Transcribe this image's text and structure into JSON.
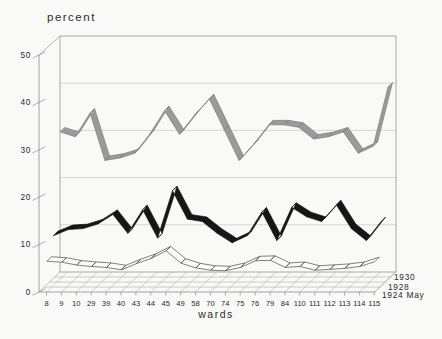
{
  "figure": {
    "y_axis_title": "percent",
    "x_axis_title": "wards",
    "background": "#f9f9f7"
  },
  "chart_data": {
    "type": "line",
    "style": "3d-ribbon",
    "title": "percent",
    "xlabel": "wards",
    "ylabel": "percent",
    "ylim": [
      0,
      50
    ],
    "y_ticks": [
      0,
      10,
      20,
      30,
      40,
      50
    ],
    "grid": true,
    "legend_position": "right-bottom",
    "categories": [
      "8",
      "9",
      "10",
      "29",
      "39",
      "40",
      "43",
      "44",
      "45",
      "49",
      "58",
      "70",
      "74",
      "75",
      "76",
      "79",
      "84",
      "110",
      "111",
      "112",
      "113",
      "114",
      "115"
    ],
    "series": [
      {
        "name": "1930",
        "color": "#9a9a9a",
        "edge_color": "#7c7c7c",
        "depth": "back",
        "values": [
          31,
          30,
          35,
          25,
          25.5,
          26.5,
          30.5,
          35.5,
          30.5,
          34.5,
          38,
          31.5,
          25,
          28.5,
          32.5,
          32.5,
          32,
          29.5,
          30,
          31,
          26.5,
          28,
          40.5
        ]
      },
      {
        "name": "1928",
        "color": "#161616",
        "edge_color": "#161616",
        "depth": "middle",
        "values": [
          10.5,
          11.8,
          12,
          13,
          15,
          11,
          16,
          10,
          20,
          14,
          13.5,
          11,
          9,
          10.5,
          15.5,
          9.5,
          16.5,
          14.5,
          13.5,
          17,
          12,
          9.5,
          13.5
        ]
      },
      {
        "name": "1924 May",
        "color": "#fbfbf9",
        "edge_color": "#4a4a4a",
        "depth": "front",
        "values": [
          6.4,
          6.2,
          5.6,
          5.3,
          5.1,
          4.6,
          5.9,
          7,
          8.6,
          6,
          5,
          4.5,
          4.4,
          5.1,
          6.5,
          6.6,
          5.1,
          5.3,
          4.5,
          4.7,
          4.9,
          5.3,
          6.3
        ]
      }
    ],
    "structure_colors": {
      "wall_grid": "#c0c0be",
      "wall_edge": "#969694",
      "floor_grid": "#a8a8a6",
      "axis_line": "#8e8e8c",
      "text": "#2b2b2b"
    }
  }
}
